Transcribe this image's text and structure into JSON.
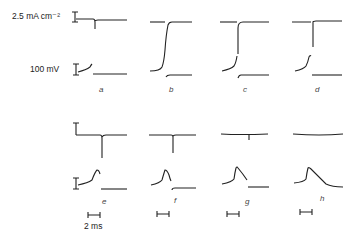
{
  "figure": {
    "scale_current": "2.5 mA cm⁻²",
    "scale_voltage": "100 mV",
    "scale_time": "2 ms",
    "panels_top": [
      "a",
      "b",
      "c",
      "d"
    ],
    "panels_bottom": [
      "e",
      "f",
      "g",
      "h"
    ]
  }
}
